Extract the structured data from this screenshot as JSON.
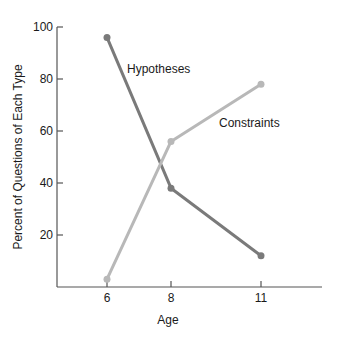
{
  "chart_data": {
    "type": "line",
    "title": "",
    "xlabel": "Age",
    "ylabel": "Percent of Questions of Each Type",
    "x": [
      6,
      8,
      11
    ],
    "x_ticks": [
      "6",
      "8",
      "11"
    ],
    "y_ticks": [
      "20",
      "40",
      "60",
      "80",
      "100"
    ],
    "ylim": [
      0,
      100
    ],
    "grid": false,
    "legend": "inline labels",
    "series": [
      {
        "name": "Hypotheses",
        "values": [
          96,
          38,
          12
        ],
        "color": "#7a7a7a"
      },
      {
        "name": "Constraints",
        "values": [
          3,
          56,
          78
        ],
        "color": "#b8b8b8"
      }
    ]
  }
}
